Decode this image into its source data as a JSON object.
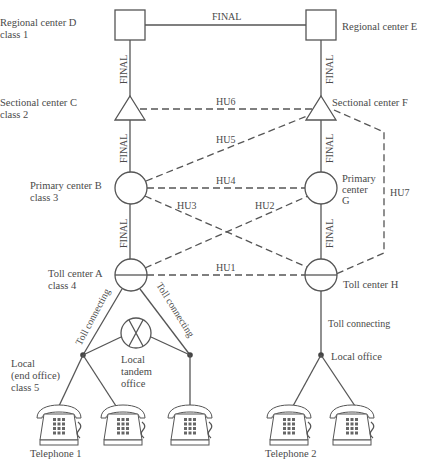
{
  "diagram": {
    "nodes": {
      "D": {
        "label_line1": "Regional center D",
        "label_line2": "class 1"
      },
      "E": {
        "label_line1": "Regional center E"
      },
      "C": {
        "label_line1": "Sectional center C",
        "label_line2": "class 2"
      },
      "F": {
        "label_line1": "Sectional center F"
      },
      "B": {
        "label_line1": "Primary center B",
        "label_line2": "class 3"
      },
      "G": {
        "label_line1": "Primary",
        "label_line2": "center",
        "label_line3": "G"
      },
      "A": {
        "label_line1": "Toll center A",
        "label_line2": "class 4"
      },
      "H": {
        "label_line1": "Toll center H"
      },
      "tandem": {
        "label_line1": "Local",
        "label_line2": "tandem",
        "label_line3": "office"
      },
      "end_office": {
        "label_line1": "Local",
        "label_line2": "(end office)",
        "label_line3": "class 5"
      },
      "local_office_right": {
        "label_line1": "Local office"
      }
    },
    "edges": {
      "DE": "FINAL",
      "DC": "FINAL",
      "EF": "FINAL",
      "CB": "FINAL",
      "FG": "FINAL",
      "BA": "FINAL",
      "GH": "FINAL",
      "HU1": "HU1",
      "HU2": "HU2",
      "HU3": "HU3",
      "HU4": "HU4",
      "HU5": "HU5",
      "HU6": "HU6",
      "HU7": "HU7",
      "toll_left": "Toll connecting",
      "toll_right_A": "Toll connecting",
      "toll_H": "Toll connecting"
    },
    "telephones": {
      "group1": "Telephone 1",
      "group2": "Telephone 2"
    },
    "legend": {
      "solid_line": "final route",
      "dashed_line": "high-usage trunk"
    }
  }
}
